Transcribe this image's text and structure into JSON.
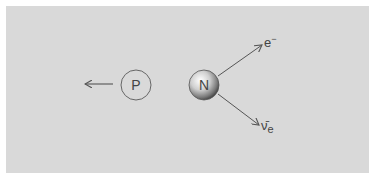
{
  "diagram": {
    "title": "",
    "background": "#d9d9d9",
    "particles": [
      {
        "id": "proton",
        "label": "P",
        "style": "outline"
      },
      {
        "id": "neutron",
        "label": "N",
        "style": "shaded-sphere"
      }
    ],
    "products": [
      {
        "id": "electron",
        "label": "e",
        "superscript": "−"
      },
      {
        "id": "antineutrino",
        "label": "ν̄",
        "subscript": "e"
      }
    ],
    "arrows": [
      {
        "from": "proton",
        "direction": "left"
      },
      {
        "from": "neutron",
        "to": "electron"
      },
      {
        "from": "neutron",
        "to": "antineutrino"
      }
    ]
  }
}
